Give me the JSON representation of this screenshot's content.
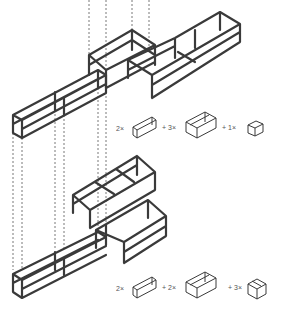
{
  "diagram": {
    "title": "",
    "configurations": [
      {
        "name": "upper-configuration",
        "legend": [
          {
            "count_label": "2×",
            "module": "long-shelf-module"
          },
          {
            "sep": "+"
          },
          {
            "count_label": "3×",
            "module": "wide-shelf-module"
          },
          {
            "sep": "+"
          },
          {
            "count_label": "1×",
            "module": "small-cube-module"
          }
        ]
      },
      {
        "name": "lower-configuration",
        "legend": [
          {
            "count_label": "2×",
            "module": "long-shelf-module"
          },
          {
            "sep": "+"
          },
          {
            "count_label": "2×",
            "module": "wide-shelf-module"
          },
          {
            "sep": "+"
          },
          {
            "count_label": "3×",
            "module": "cube-module"
          }
        ]
      }
    ],
    "colors": {
      "frame": "#3a3a3a",
      "background": "#ffffff",
      "guides": "#555555"
    }
  }
}
